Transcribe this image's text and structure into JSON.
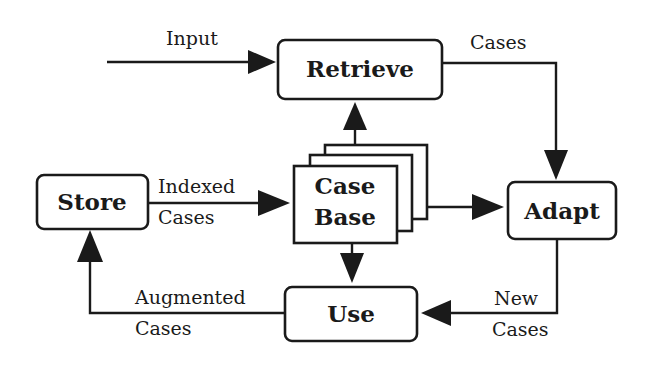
{
  "diagram": {
    "nodes": {
      "retrieve": "Retrieve",
      "case_base_line1": "Case",
      "case_base_line2": "Base",
      "store": "Store",
      "adapt": "Adapt",
      "use": "Use"
    },
    "edges": {
      "input": "Input",
      "cases": "Cases",
      "indexed_1": "Indexed",
      "indexed_2": "Cases",
      "augmented_1": "Augmented",
      "augmented_2": "Cases",
      "new_1": "New",
      "new_2": "Cases"
    },
    "colors": {
      "ink": "#1a1a1a",
      "background": "#ffffff"
    }
  }
}
